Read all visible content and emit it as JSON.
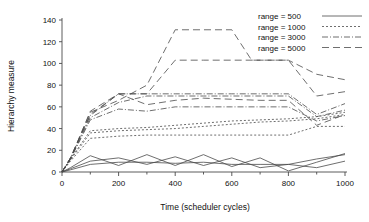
{
  "chart_data": {
    "type": "line",
    "title": "",
    "xlabel": "Time (scheduler cycles)",
    "ylabel": "Hierarchy measure",
    "xlim": [
      0,
      1000
    ],
    "ylim": [
      0,
      140
    ],
    "xticks": [
      0,
      200,
      400,
      600,
      800,
      1000
    ],
    "xtick_labels": [
      "0",
      "200",
      "400",
      "600",
      "800",
      "1000"
    ],
    "xminor_step": 100,
    "yticks": [
      0,
      20,
      40,
      60,
      80,
      100,
      120,
      140
    ],
    "ytick_labels": [
      "0",
      "20",
      "40",
      "60",
      "80",
      "100",
      "120",
      "140"
    ],
    "grid": false,
    "legend_position": "top-right",
    "legend": [
      {
        "label": "range = 500",
        "dash": "none",
        "style_key": "solid"
      },
      {
        "label": "range = 1000",
        "dash": "2 2",
        "style_key": "dotted"
      },
      {
        "label": "range = 3000",
        "dash": "6 2 1 2",
        "style_key": "dash-dot"
      },
      {
        "label": "range = 5000",
        "dash": "7 4",
        "style_key": "dashed"
      }
    ],
    "series": [
      {
        "name": "range = 500 (run 1)",
        "group": "range = 500",
        "dash": "none",
        "x": [
          0,
          30,
          100,
          200,
          300,
          400,
          500,
          600,
          700,
          800,
          900,
          1000
        ],
        "values": [
          0,
          4,
          15,
          6,
          16,
          6,
          16,
          5,
          13,
          1,
          9,
          17
        ]
      },
      {
        "name": "range = 500 (run 2)",
        "group": "range = 500",
        "dash": "none",
        "x": [
          0,
          30,
          100,
          200,
          300,
          400,
          500,
          600,
          700,
          800,
          900,
          1000
        ],
        "values": [
          0,
          3,
          10,
          13,
          7,
          14,
          6,
          13,
          4,
          7,
          4,
          10
        ]
      },
      {
        "name": "range = 500 (run 3)",
        "group": "range = 500",
        "dash": "none",
        "x": [
          0,
          30,
          100,
          200,
          300,
          400,
          500,
          600,
          700,
          800,
          900,
          1000
        ],
        "values": [
          0,
          2,
          7,
          9,
          9,
          8,
          9,
          7,
          7,
          7,
          12,
          16
        ]
      },
      {
        "name": "range = 1000 (run 1)",
        "group": "range = 1000",
        "dash": "2 2",
        "x": [
          0,
          30,
          100,
          200,
          300,
          400,
          500,
          600,
          700,
          800,
          900,
          1000
        ],
        "values": [
          0,
          10,
          31,
          33,
          34,
          34,
          34,
          34,
          34,
          34,
          42,
          42
        ]
      },
      {
        "name": "range = 1000 (run 2)",
        "group": "range = 1000",
        "dash": "2 2",
        "x": [
          0,
          30,
          100,
          200,
          300,
          400,
          500,
          600,
          700,
          800,
          900,
          1000
        ],
        "values": [
          0,
          11,
          36,
          38,
          39,
          40,
          42,
          44,
          46,
          47,
          49,
          53
        ]
      },
      {
        "name": "range = 1000 (run 3)",
        "group": "range = 1000",
        "dash": "2 2",
        "x": [
          0,
          30,
          100,
          200,
          300,
          400,
          500,
          600,
          700,
          800,
          900,
          1000
        ],
        "values": [
          0,
          12,
          38,
          40,
          41,
          43,
          45,
          47,
          48,
          49,
          51,
          55
        ]
      },
      {
        "name": "range = 3000 (run 1)",
        "group": "range = 3000",
        "dash": "6 2 1 2",
        "x": [
          0,
          30,
          100,
          200,
          300,
          400,
          500,
          600,
          700,
          800,
          900,
          1000
        ],
        "values": [
          0,
          13,
          52,
          72,
          72,
          72,
          72,
          72,
          72,
          72,
          53,
          63
        ]
      },
      {
        "name": "range = 3000 (run 2)",
        "group": "range = 3000",
        "dash": "6 2 1 2",
        "x": [
          0,
          30,
          100,
          200,
          300,
          400,
          500,
          600,
          700,
          800,
          900,
          1000
        ],
        "values": [
          0,
          12,
          50,
          64,
          70,
          70,
          70,
          70,
          70,
          70,
          51,
          57
        ]
      },
      {
        "name": "range = 3000 (run 3)",
        "group": "range = 3000",
        "dash": "6 2 1 2",
        "x": [
          0,
          30,
          100,
          200,
          300,
          400,
          500,
          600,
          700,
          800,
          900,
          1000
        ],
        "values": [
          0,
          12,
          48,
          58,
          56,
          60,
          60,
          60,
          60,
          60,
          47,
          52
        ]
      },
      {
        "name": "range = 5000 (run 1)",
        "group": "range = 5000",
        "dash": "7 4",
        "x": [
          0,
          30,
          100,
          200,
          300,
          400,
          500,
          600,
          670,
          800,
          900,
          1000
        ],
        "values": [
          0,
          13,
          55,
          66,
          80,
          131,
          131,
          131,
          103,
          103,
          90,
          85
        ]
      },
      {
        "name": "range = 5000 (run 2)",
        "group": "range = 5000",
        "dash": "7 4",
        "x": [
          0,
          30,
          100,
          200,
          300,
          400,
          500,
          600,
          700,
          800,
          900,
          1000
        ],
        "values": [
          0,
          13,
          53,
          72,
          72,
          103,
          103,
          103,
          103,
          103,
          70,
          74
        ]
      },
      {
        "name": "range = 5000 (run 3)",
        "group": "range = 5000",
        "dash": "7 4",
        "x": [
          0,
          30,
          100,
          200,
          300,
          400,
          500,
          600,
          700,
          800,
          900,
          1000
        ],
        "values": [
          0,
          12,
          56,
          72,
          62,
          66,
          68,
          67,
          66,
          66,
          43,
          53
        ]
      }
    ]
  },
  "style": {
    "line_color": "#4a4a4a",
    "axis_color": "#4a4a4a",
    "background": "#ffffff"
  }
}
